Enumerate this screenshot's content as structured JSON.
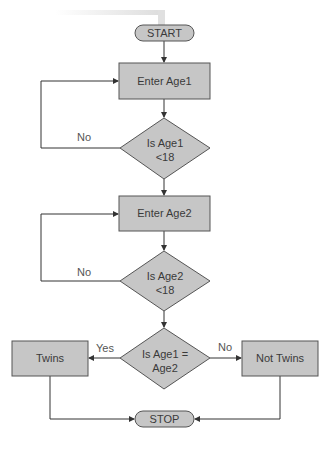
{
  "diagram": {
    "type": "flowchart",
    "colors": {
      "fill": "#c6c6c6",
      "stroke": "#555555",
      "line": "#333333",
      "text": "#3a3a3a",
      "shadow": "#e4e4e4"
    },
    "nodes": {
      "start": {
        "shape": "terminator",
        "label": "START"
      },
      "enter_age1": {
        "shape": "process",
        "label": "Enter Age1"
      },
      "check_age1": {
        "shape": "decision",
        "line1": "Is Age1",
        "line2": "<18"
      },
      "enter_age2": {
        "shape": "process",
        "label": "Enter Age2"
      },
      "check_age2": {
        "shape": "decision",
        "line1": "Is Age2",
        "line2": "<18"
      },
      "compare": {
        "shape": "decision",
        "line1": "Is Age1 =",
        "line2": "Age2"
      },
      "twins": {
        "shape": "process",
        "label": "Twins"
      },
      "not_twins": {
        "shape": "process",
        "label": "Not Twins"
      },
      "stop": {
        "shape": "terminator",
        "label": "STOP"
      }
    },
    "edges": {
      "age1_no": "No",
      "age2_no": "No",
      "compare_yes": "Yes",
      "compare_no": "No"
    }
  }
}
